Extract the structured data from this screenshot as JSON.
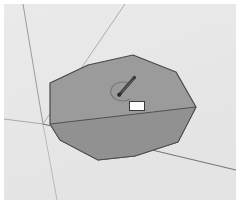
{
  "app": {
    "name": "3d-modeling-viewport",
    "background_color": "#e8e8e8",
    "frame_color": "#ffffff"
  },
  "viewport": {
    "width": 232,
    "height": 196,
    "origin": {
      "x": 43,
      "y": 124
    }
  },
  "axes": [
    {
      "name": "green-axis",
      "color": "#8f9a8f",
      "x1": 23,
      "y1": 4,
      "x2": 43,
      "y2": 124,
      "width": 1
    },
    {
      "name": "blue-axis-upper",
      "color": "#9a9aa8",
      "x1": 125,
      "y1": 4,
      "x2": 43,
      "y2": 124,
      "width": 1
    },
    {
      "name": "green-axis-lower",
      "color": "#a8aaa8",
      "x1": 43,
      "y1": 124,
      "x2": 57,
      "y2": 200,
      "width": 1
    },
    {
      "name": "red-axis-left",
      "color": "#a09a9a",
      "x1": 4,
      "y1": 119,
      "x2": 43,
      "y2": 124,
      "width": 1
    },
    {
      "name": "red-axis-right",
      "color": "#6e6e6e",
      "x1": 43,
      "y1": 124,
      "x2": 236,
      "y2": 170,
      "width": 1
    }
  ],
  "shape": {
    "name": "extruded-polygon",
    "type": "decagon",
    "fill_color": "#9a9a9a",
    "stroke_color": "#4a4a4a",
    "stroke_width": 1.2,
    "vertices": [
      {
        "x": 88,
        "y": 65
      },
      {
        "x": 133,
        "y": 55
      },
      {
        "x": 176,
        "y": 72
      },
      {
        "x": 196,
        "y": 107
      },
      {
        "x": 178,
        "y": 142
      },
      {
        "x": 135,
        "y": 156
      },
      {
        "x": 98,
        "y": 160
      },
      {
        "x": 60,
        "y": 140
      },
      {
        "x": 50,
        "y": 124
      },
      {
        "x": 50,
        "y": 83
      }
    ],
    "bottom_face": {
      "name": "lower-face",
      "fill_color": "#8e8e8e",
      "vertices": [
        {
          "x": 50,
          "y": 124
        },
        {
          "x": 196,
          "y": 107
        },
        {
          "x": 178,
          "y": 142
        },
        {
          "x": 135,
          "y": 156
        },
        {
          "x": 98,
          "y": 160
        },
        {
          "x": 60,
          "y": 140
        }
      ]
    }
  },
  "inference_arc": {
    "name": "center-inference-arc",
    "color": "#6d6d6d",
    "cx": 120,
    "cy": 88,
    "rx": 12,
    "ry": 9
  },
  "cursor": {
    "name": "pencil-tool-cursor",
    "tip": {
      "x": 118,
      "y": 92
    },
    "tail": {
      "x": 134,
      "y": 76
    },
    "body_color": "#3d3d3d",
    "shaft_color": "#555555",
    "point_color": "#2b2b2b"
  },
  "vcb": {
    "name": "measurement-value-box",
    "label": "",
    "x": 125,
    "y": 97,
    "width": 16,
    "height": 10,
    "background": "#ffffff",
    "border_color": "#3a3a3a",
    "text_color": "#222222"
  }
}
